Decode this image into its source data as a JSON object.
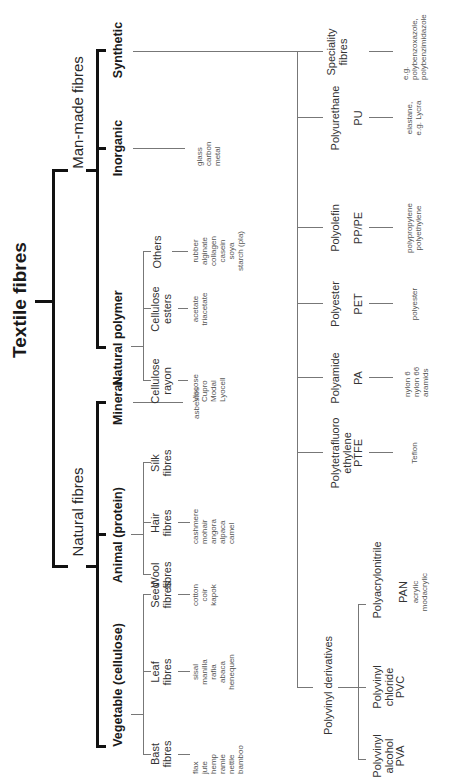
{
  "title": "Textile fibres",
  "natural": {
    "label": "Natural fibres",
    "vegetable": {
      "label": "Vegetable (cellulose)",
      "bast": {
        "label": "Bast\nfibres",
        "examples": "flax\njute\nhemp\nramie\nnettle\nbamboo"
      },
      "leaf": {
        "label": "Leaf\nfibres",
        "examples": "sisal\nmanilla\nrafia\nabaca\nhenequen"
      },
      "seed": {
        "label": "Seed\nfibres",
        "examples": "cotton\ncoir\nkapok"
      }
    },
    "animal": {
      "label": "Animal (protein)",
      "wool": {
        "label": "Wool\nfibres"
      },
      "hair": {
        "label": "Hair\nfibres",
        "examples": "cashmere\nmohair\nangora\nalpaca\ncamel"
      },
      "silk": {
        "label": "Silk\nfibres"
      }
    },
    "mineral": {
      "label": "Mineral",
      "examples": "asbestos"
    }
  },
  "manmade": {
    "label": "Man-made fibres",
    "natural_polymer": {
      "label": "Natural polymer",
      "rayon": {
        "label": "Cellulose\nrayon",
        "examples": "Viscose\nCupro\nModal\nLyocell"
      },
      "esters": {
        "label": "Cellulose\nesters",
        "examples": "acetate\ntriacetate"
      },
      "others": {
        "label": "Others",
        "examples": "rubber\nalginate\ncollagen\ncasein\nsoya\nstarch (pla)"
      }
    },
    "inorganic": {
      "label": "Inorganic",
      "examples": "glass\ncarbon\nmetal"
    },
    "synthetic": {
      "label": "Synthetic",
      "polyvinyl": {
        "label": "Polyvinyl derivatives",
        "pva": {
          "label": "Polyvinyl\nalcohol\nPVA"
        },
        "pvc": {
          "label": "Polyvinyl\nchloride\nPVC"
        },
        "pan": {
          "label": "Polyacrylonitrile",
          "abbr": "PAN",
          "examples": "acrylic\nmodacrylic"
        }
      },
      "ptfe": {
        "label": "Polytetrafluoro\nethylene\nPTFE",
        "examples": "Teflon"
      },
      "polyamide": {
        "label": "Polyamide",
        "abbr": "PA",
        "examples": "nylon 6\nnylon 66\naramids"
      },
      "polyester": {
        "label": "Polyester",
        "abbr": "PET",
        "examples": "polyester"
      },
      "polyolefin": {
        "label": "Polyolefin",
        "abbr": "PP/PE",
        "examples": "polypropylene\npolyethylene"
      },
      "polyurethane": {
        "label": "Polyurethane",
        "abbr": "PU",
        "examples": "elastane,\ne.g. Lycra"
      },
      "speciality": {
        "label": "Speciality\nfibres",
        "examples": "e.g.\npolybenzoxazole,\npolybenzimidazole"
      }
    }
  },
  "colors": {
    "line_dark": "#111111",
    "line_mid": "#333333",
    "line_light": "#777777",
    "text": "#222222",
    "example_text": "#555555"
  }
}
